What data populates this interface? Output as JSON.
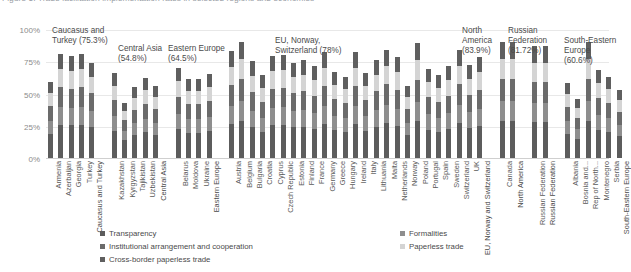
{
  "figure": {
    "title": "Figure 5: Trade facilitation implementation rates in selected regions and economies",
    "yaxis": {
      "ticks": [
        "0%",
        "25%",
        "50%",
        "75%",
        "100%"
      ]
    }
  },
  "legend": {
    "column1": [
      {
        "label": "Transparency",
        "color": "#5c5c5c"
      },
      {
        "label": "Institutional arrangement and cooperation",
        "color": "#6b6b6b"
      },
      {
        "label": "Cross-border paperless trade",
        "color": "#5f5f5f"
      }
    ],
    "column2": [
      {
        "label": "Formalities",
        "color": "#8e8e8e"
      },
      {
        "label": "Paperless trade",
        "color": "#d4d4d4"
      }
    ]
  },
  "annotations": [
    {
      "text": "Caucasus and\nTurkey (75.3%)"
    },
    {
      "text": "Central Asia\n(54.8%)"
    },
    {
      "text": "Eastern Europe\n(64.5%)"
    },
    {
      "text": "EU, Norway,\nSwitzerland (78%)"
    },
    {
      "text": "North\nAmerica\n(83.9%)"
    },
    {
      "text": "Russian\nFederation\n(81.72%)"
    },
    {
      "text": "South-Eastern\nEurope (60.6%)"
    }
  ],
  "chart_data": {
    "type": "bar",
    "stacked": true,
    "title": "Figure 5: Trade facilitation implementation rates in selected regions and economies",
    "xlabel": "",
    "ylabel": "",
    "ylim": [
      0,
      100
    ],
    "yticks": [
      0,
      25,
      50,
      75,
      100
    ],
    "grid": true,
    "legend_position": "bottom",
    "series": [
      {
        "name": "Transparency",
        "color": "#5c5c5c"
      },
      {
        "name": "Formalities",
        "color": "#8e8e8e"
      },
      {
        "name": "Institutional arrangement and cooperation",
        "color": "#6b6b6b"
      },
      {
        "name": "Paperless trade",
        "color": "#d4d4d4"
      },
      {
        "name": "Cross-border paperless trade",
        "color": "#5f5f5f"
      }
    ],
    "groups": [
      {
        "name": "Caucasus and Turkey",
        "average": 75.3,
        "categories": [
          "Armenia",
          "Azerbaijan",
          "Georgia",
          "Turkey",
          "Caucasus and Turkey"
        ],
        "totals": [
          59,
          81,
          79,
          81,
          74
        ]
      },
      {
        "name": "Central Asia",
        "average": 54.8,
        "categories": [
          "Kazakhstan",
          "Kyrgyzstan",
          "Tajikistan",
          "Uzbekistan",
          "Central Asia"
        ],
        "totals": [
          66,
          43,
          55,
          62,
          56
        ]
      },
      {
        "name": "Eastern Europe",
        "average": 64.5,
        "categories": [
          "Belarus",
          "Moldova",
          "Ukraine",
          "Eastern Europe"
        ],
        "totals": [
          70,
          61,
          61,
          65
        ]
      },
      {
        "name": "EU, Norway, Switzerland",
        "average": 78,
        "categories": [
          "Austria",
          "Belgium",
          "Bulgaria",
          "Croatia",
          "Cyprus",
          "Czech Republic",
          "Estonia",
          "Finland",
          "France",
          "Germany",
          "Greece",
          "Hungary",
          "Ireland",
          "Italy",
          "Lithuania",
          "Malta",
          "Netherlands",
          "Norway",
          "Poland",
          "Portugal",
          "Spain",
          "Sweden",
          "Switzerland",
          "UK",
          "EU, Norway and Switzerland"
        ],
        "totals": [
          83,
          90,
          75,
          64,
          79,
          80,
          74,
          76,
          71,
          82,
          67,
          63,
          82,
          66,
          76,
          84,
          78,
          56,
          89,
          69,
          64,
          71,
          84,
          72,
          78
        ]
      },
      {
        "name": "North America",
        "average": 83.9,
        "categories": [
          "Canada",
          "North America"
        ],
        "totals": [
          90,
          90
        ]
      },
      {
        "name": "Russian Federation",
        "average": 81.72,
        "categories": [
          "Russian Federation",
          "Russian Federation"
        ],
        "totals": [
          87,
          87
        ]
      },
      {
        "name": "South-Eastern Europe",
        "average": 60.6,
        "categories": [
          "Albania",
          "Bosnia and...",
          "Rep of North...",
          "Montenegro",
          "Serbia",
          "South-Eastern Europe"
        ],
        "totals": [
          58,
          46,
          90,
          68,
          63,
          53
        ]
      }
    ],
    "stack_fractions": [
      0.32,
      0.17,
      0.19,
      0.17,
      0.15
    ]
  }
}
